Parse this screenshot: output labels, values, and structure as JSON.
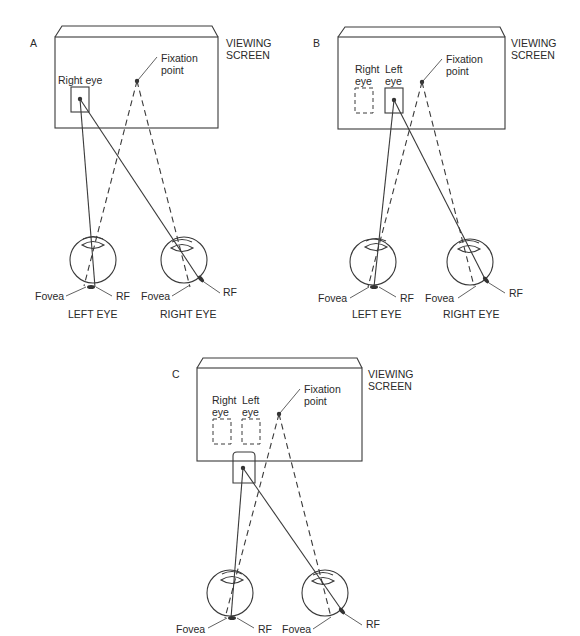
{
  "panels": [
    {
      "id": "A",
      "letter": "A",
      "screen_label_1": "VIEWING",
      "screen_label_2": "SCREEN",
      "fixation_label_1": "Fixation",
      "fixation_label_2": "point",
      "eye_box_labels": [
        "Right eye"
      ],
      "left_eye": {
        "fovea": "Fovea",
        "rf": "RF",
        "name": "LEFT EYE"
      },
      "right_eye": {
        "fovea": "Fovea",
        "rf": "RF",
        "name": "RIGHT EYE"
      }
    },
    {
      "id": "B",
      "letter": "B",
      "screen_label_1": "VIEWING",
      "screen_label_2": "SCREEN",
      "fixation_label_1": "Fixation",
      "fixation_label_2": "point",
      "right_box_label_1": "Right",
      "right_box_label_2": "eye",
      "left_box_label_1": "Left",
      "left_box_label_2": "eye",
      "left_eye": {
        "fovea": "Fovea",
        "rf": "RF",
        "name": "LEFT EYE"
      },
      "right_eye": {
        "fovea": "Fovea",
        "rf": "RF",
        "name": "RIGHT EYE"
      }
    },
    {
      "id": "C",
      "letter": "C",
      "screen_label_1": "VIEWING",
      "screen_label_2": "SCREEN",
      "fixation_label_1": "Fixation",
      "fixation_label_2": "point",
      "right_box_label_1": "Right",
      "right_box_label_2": "eye",
      "left_box_label_1": "Left",
      "left_box_label_2": "eye",
      "left_eye": {
        "fovea": "Fovea",
        "rf": "RF"
      },
      "right_eye": {
        "fovea": "Fovea",
        "rf": "RF"
      }
    }
  ]
}
